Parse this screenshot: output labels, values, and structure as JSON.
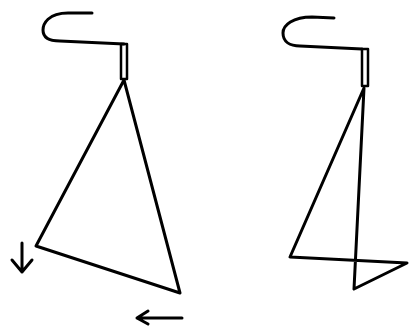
{
  "diagram": {
    "title": "",
    "stroke_color": "#000000",
    "background": "#ffffff",
    "figures": [
      {
        "name": "hanger-left",
        "description": "Hanger with triangular frame, tilted"
      },
      {
        "name": "hanger-right",
        "description": "Hanger with folded/crossed frame"
      }
    ],
    "arrows": [
      {
        "name": "down-arrow",
        "direction": "down"
      },
      {
        "name": "left-arrow",
        "direction": "left"
      }
    ]
  }
}
